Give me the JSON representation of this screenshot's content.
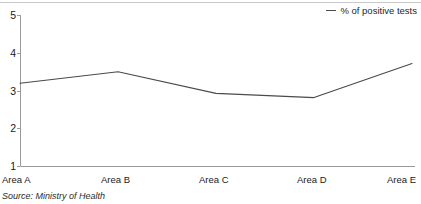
{
  "chart_data": {
    "type": "line",
    "title": "",
    "subtitle": "",
    "xlabel": "",
    "ylabel": "",
    "categories": [
      "Area A",
      "Area B",
      "Area C",
      "Area D",
      "Area E"
    ],
    "series": [
      {
        "name": "% of positive tests",
        "values": [
          3.2,
          3.5,
          2.93,
          2.82,
          3.72
        ],
        "color": "#4a4a4a"
      }
    ],
    "ylim": [
      1,
      5
    ],
    "yticks": [
      1,
      2,
      3,
      4,
      5
    ],
    "ytick_labels": [
      "1",
      "2",
      "3",
      "4",
      "5"
    ],
    "grid": false,
    "legend": {
      "position": "top-right",
      "entries": [
        "% of positive tests"
      ]
    },
    "annotations": [
      "Source: Ministry of Health"
    ]
  },
  "legend": {
    "label": "% of positive tests",
    "marker": "line-dash-icon"
  },
  "footer": {
    "source": "Source: Ministry of Health"
  },
  "colors": {
    "series_line": "#4a4a4a",
    "axis": "#9a9a9a",
    "top_rule": "#c9c9c9",
    "text": "#1a1a1a"
  }
}
